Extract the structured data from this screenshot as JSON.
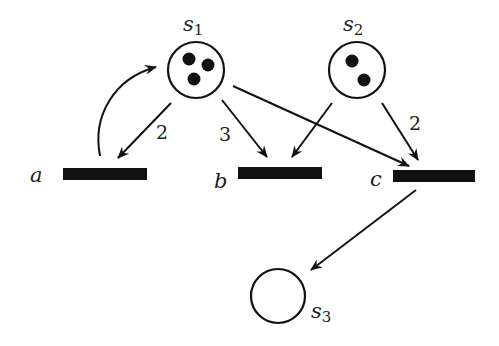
{
  "diagram": {
    "type": "petri-net",
    "colors": {
      "stroke": "#111111",
      "fill": "#ffffff",
      "token": "#111111",
      "transition": "#111111"
    },
    "places": [
      {
        "id": "s1",
        "label": "s",
        "sub": "1",
        "tokens": 3
      },
      {
        "id": "s2",
        "label": "s",
        "sub": "2",
        "tokens": 2
      },
      {
        "id": "s3",
        "label": "s",
        "sub": "3",
        "tokens": 0
      }
    ],
    "transitions": [
      {
        "id": "a",
        "label": "a"
      },
      {
        "id": "b",
        "label": "b"
      },
      {
        "id": "c",
        "label": "c"
      }
    ],
    "arcs": [
      {
        "from": "s1",
        "to": "a",
        "weight": "2"
      },
      {
        "from": "a",
        "to": "s1",
        "weight": ""
      },
      {
        "from": "s1",
        "to": "b",
        "weight": "3"
      },
      {
        "from": "s1",
        "to": "c",
        "weight": ""
      },
      {
        "from": "s2",
        "to": "b",
        "weight": ""
      },
      {
        "from": "s2",
        "to": "c",
        "weight": "2"
      },
      {
        "from": "c",
        "to": "s3",
        "weight": ""
      }
    ]
  }
}
